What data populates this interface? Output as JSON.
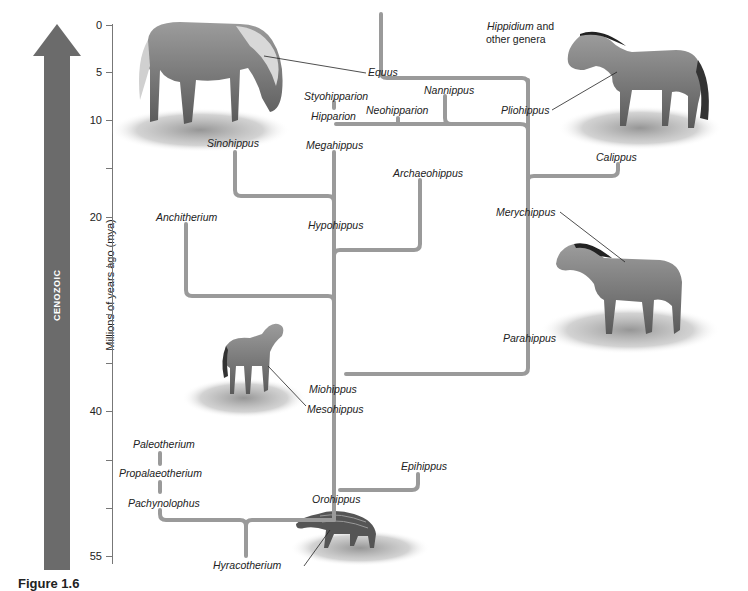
{
  "era": {
    "label": "CENOZOIC",
    "color": "#6b6b6b"
  },
  "axis": {
    "title": "Millions of years ago (mya)",
    "ticks": [
      {
        "label": "0",
        "y": 25
      },
      {
        "label": "5",
        "y": 72
      },
      {
        "label": "10",
        "y": 120
      },
      {
        "label": "",
        "y": 168
      },
      {
        "label": "20",
        "y": 217
      },
      {
        "label": "",
        "y": 266
      },
      {
        "label": "",
        "y": 314
      },
      {
        "label": "",
        "y": 363
      },
      {
        "label": "40",
        "y": 411
      },
      {
        "label": "",
        "y": 460
      },
      {
        "label": "",
        "y": 508
      },
      {
        "label": "55",
        "y": 556
      }
    ]
  },
  "taxa": {
    "equus": "Equus",
    "hippidium": "Hippidium",
    "hippidium_suffix": " and",
    "other_genera": "other genera",
    "nannippus": "Nannippus",
    "styohipparion": "Styohipparion",
    "neohipparion": "Neohipparion",
    "hipparion": "Hipparion",
    "pliohippus": "Pliohippus",
    "sinohippus": "Sinohippus",
    "megahippus": "Megahippus",
    "calippus": "Calippus",
    "archaeohippus": "Archaeohippus",
    "anchitherium": "Anchitherium",
    "hypohippus": "Hypohippus",
    "merychippus": "Merychippus",
    "parahippus": "Parahippus",
    "miohippus": "Miohippus",
    "mesohippus": "Mesohippus",
    "paleotherium": "Paleotherium",
    "propalaeotherium": "Propalaeotherium",
    "pachynolophus": "Pachynolophus",
    "epihippus": "Epihippus",
    "orohippus": "Orohippus",
    "hyracotherium": "Hyracotherium"
  },
  "illustrations": [
    {
      "name": "equus-horse",
      "label": "Equus"
    },
    {
      "name": "pliohippus-horse",
      "label": "Pliohippus"
    },
    {
      "name": "merychippus-horse",
      "label": "Merychippus"
    },
    {
      "name": "mesohippus-horse",
      "label": "Mesohippus"
    },
    {
      "name": "hyracotherium-animal",
      "label": "Hyracotherium"
    }
  ],
  "branch_color": "#9a9a9a",
  "caption": "Figure 1.6"
}
